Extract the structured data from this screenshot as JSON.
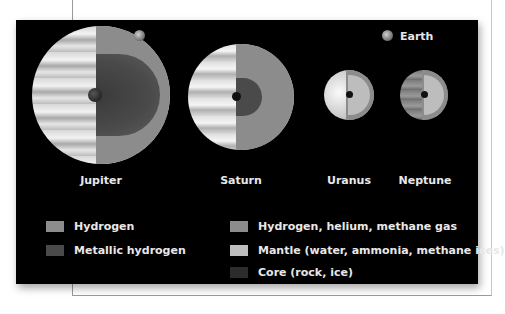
{
  "diagram": {
    "earth_label": "Earth",
    "planets": [
      {
        "name": "Jupiter"
      },
      {
        "name": "Saturn"
      },
      {
        "name": "Uranus"
      },
      {
        "name": "Neptune"
      }
    ],
    "legend_left": [
      {
        "label": "Hydrogen",
        "color": "#8c8c8c"
      },
      {
        "label": "Metallic hydrogen",
        "color": "#4a4a4a"
      }
    ],
    "legend_right": [
      {
        "label": "Hydrogen, helium, methane gas",
        "color": "#8c8c8c"
      },
      {
        "label": "Mantle (water, ammonia, methane ices)",
        "color": "#bdbdbd"
      },
      {
        "label": "Core (rock, ice)",
        "color": "#2c2c2c"
      }
    ]
  }
}
